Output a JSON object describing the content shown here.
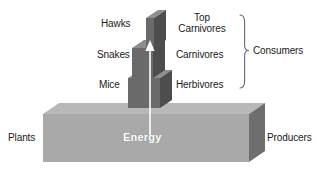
{
  "diagram": {
    "background_color": "#ffffff",
    "text_color": "#1a1a1a",
    "energy_label": "Energy",
    "energy_label_color": "#ffffff",
    "arrow_color": "#ffffff",
    "arrow_direction": "up"
  },
  "colors": {
    "base_top": "#b8b8b8",
    "base_front": "#a9a9a9",
    "base_side": "#6e6e6e",
    "block_top": "#8e8e8e",
    "block_front": "#6a6a6a",
    "block_side": "#4d4d4d",
    "brace": "#6b6b6b"
  },
  "organisms": [
    {
      "name": "Hawks",
      "trophic_level": "Top Carnivores",
      "tier": 3
    },
    {
      "name": "Snakes",
      "trophic_level": "Carnivores",
      "tier": 2
    },
    {
      "name": "Mice",
      "trophic_level": "Herbivores",
      "tier": 1
    }
  ],
  "left_labels": {
    "hawks": "Hawks",
    "snakes": "Snakes",
    "mice": "Mice"
  },
  "right_labels": {
    "top_carnivores_line1": "Top",
    "top_carnivores_line2": "Carnivores",
    "carnivores": "Carnivores",
    "herbivores": "Herbivores"
  },
  "grouping": {
    "consumers": "Consumers",
    "producers": "Producers"
  },
  "base": {
    "left_label": "Plants",
    "right_label": "Producers"
  }
}
